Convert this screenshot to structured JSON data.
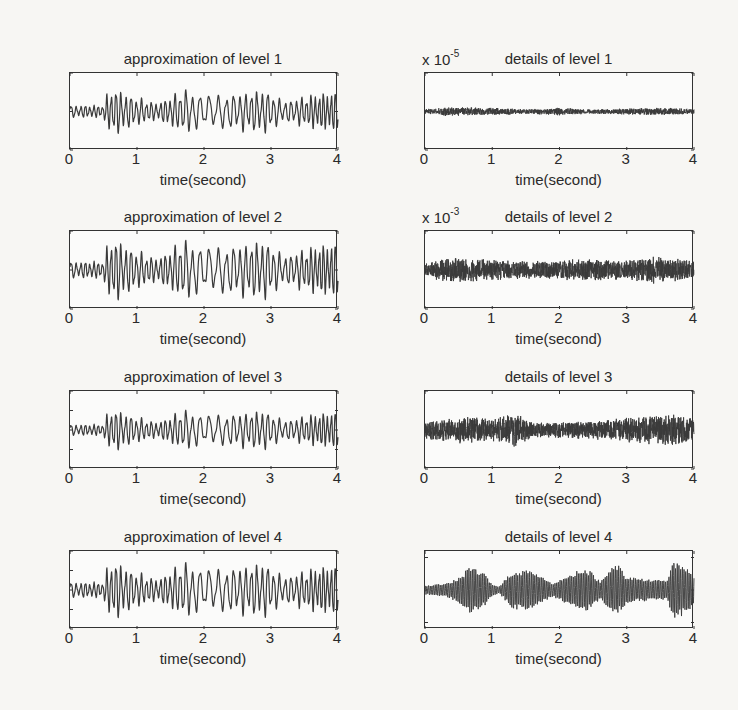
{
  "chart_data": [
    {
      "type": "line",
      "id": "a1",
      "title": "approximation of level 1",
      "xlabel": "time(second)",
      "ylabel": "",
      "xlim": [
        0,
        4
      ],
      "ylim": [
        -20,
        20
      ],
      "xticks": [
        "0",
        "1",
        "2",
        "3",
        "4"
      ],
      "yticks": [
        "20",
        "0",
        "-20"
      ],
      "multiplier": "",
      "grid": false,
      "signal": {
        "kind": "approx",
        "amp": 1.0,
        "freq": 12,
        "envelope": [
          [
            0,
            3
          ],
          [
            0.5,
            3
          ],
          [
            0.55,
            8
          ],
          [
            0.65,
            12
          ],
          [
            0.9,
            8
          ],
          [
            1.3,
            4
          ],
          [
            1.7,
            11
          ],
          [
            2.0,
            8
          ],
          [
            2.5,
            9
          ],
          [
            2.9,
            11
          ],
          [
            3.2,
            5
          ],
          [
            3.7,
            9
          ],
          [
            4.0,
            10
          ]
        ]
      }
    },
    {
      "type": "line",
      "id": "d1",
      "title": "details of level 1",
      "xlabel": "time(second)",
      "ylabel": "",
      "xlim": [
        0,
        4
      ],
      "ylim": [
        -5,
        5
      ],
      "xticks": [
        "0",
        "1",
        "2",
        "3",
        "4"
      ],
      "yticks": [
        "5",
        "0",
        "-5"
      ],
      "multiplier": "x 10",
      "multiplier_exp": "-5",
      "grid": false,
      "signal": {
        "kind": "noise",
        "freq": 90,
        "envelope": [
          [
            0,
            0.3
          ],
          [
            0.3,
            0.6
          ],
          [
            1.0,
            0.5
          ],
          [
            1.5,
            0.3
          ],
          [
            2.0,
            0.5
          ],
          [
            2.5,
            0.3
          ],
          [
            3.5,
            0.5
          ],
          [
            4.0,
            0.4
          ]
        ]
      }
    },
    {
      "type": "line",
      "id": "a2",
      "title": "approximation of level 2",
      "xlabel": "time(second)",
      "ylabel": "",
      "xlim": [
        0,
        4
      ],
      "ylim": [
        -20,
        20
      ],
      "xticks": [
        "0",
        "1",
        "2",
        "3",
        "4"
      ],
      "yticks": [
        "20",
        "0",
        "-20"
      ],
      "multiplier": "",
      "grid": false,
      "signal": {
        "kind": "approx",
        "amp": 1.35,
        "freq": 12,
        "envelope": [
          [
            0,
            3
          ],
          [
            0.5,
            3
          ],
          [
            0.55,
            8
          ],
          [
            0.65,
            12
          ],
          [
            0.9,
            8
          ],
          [
            1.3,
            4
          ],
          [
            1.7,
            11
          ],
          [
            2.0,
            8
          ],
          [
            2.5,
            9
          ],
          [
            2.9,
            11
          ],
          [
            3.2,
            5
          ],
          [
            3.7,
            9
          ],
          [
            4.0,
            10
          ]
        ]
      }
    },
    {
      "type": "line",
      "id": "d2",
      "title": "details of level 2",
      "xlabel": "time(second)",
      "ylabel": "",
      "xlim": [
        0,
        4
      ],
      "ylim": [
        -5,
        5
      ],
      "xticks": [
        "0",
        "1",
        "2",
        "3",
        "4"
      ],
      "yticks": [
        "5",
        "0",
        "-5"
      ],
      "multiplier": "x 10",
      "multiplier_exp": "-3",
      "grid": false,
      "signal": {
        "kind": "noise",
        "freq": 90,
        "envelope": [
          [
            0,
            0.8
          ],
          [
            0.3,
            1.6
          ],
          [
            0.6,
            1.6
          ],
          [
            1.0,
            1.4
          ],
          [
            1.5,
            1.2
          ],
          [
            2.0,
            1.2
          ],
          [
            2.3,
            1.6
          ],
          [
            3.0,
            1.2
          ],
          [
            3.4,
            1.8
          ],
          [
            4.0,
            1.2
          ]
        ]
      }
    },
    {
      "type": "line",
      "id": "a3",
      "title": "approximation of level 3",
      "xlabel": "time(second)",
      "ylabel": "",
      "xlim": [
        0,
        4
      ],
      "ylim": [
        -40,
        40
      ],
      "xticks": [
        "0",
        "1",
        "2",
        "3",
        "4"
      ],
      "yticks": [
        "40",
        "20",
        "0",
        "-20",
        "-40"
      ],
      "multiplier": "",
      "grid": false,
      "signal": {
        "kind": "approx",
        "amp": 1.8,
        "freq": 12,
        "envelope": [
          [
            0,
            3
          ],
          [
            0.5,
            3
          ],
          [
            0.55,
            8
          ],
          [
            0.65,
            12
          ],
          [
            0.9,
            8
          ],
          [
            1.3,
            4
          ],
          [
            1.7,
            11
          ],
          [
            2.0,
            8
          ],
          [
            2.5,
            9
          ],
          [
            2.9,
            11
          ],
          [
            3.2,
            5
          ],
          [
            3.7,
            9
          ],
          [
            4.0,
            10
          ]
        ]
      }
    },
    {
      "type": "line",
      "id": "d3",
      "title": "details of level 3",
      "xlabel": "time(second)",
      "ylabel": "",
      "xlim": [
        0,
        4
      ],
      "ylim": [
        -0.5,
        0.5
      ],
      "xticks": [
        "0",
        "1",
        "2",
        "3",
        "4"
      ],
      "yticks": [
        "0.5",
        "0",
        "-0.5"
      ],
      "multiplier": "",
      "grid": false,
      "signal": {
        "kind": "noise",
        "freq": 60,
        "envelope": [
          [
            0,
            0.12
          ],
          [
            0.6,
            0.18
          ],
          [
            1.0,
            0.14
          ],
          [
            1.35,
            0.22
          ],
          [
            1.6,
            0.1
          ],
          [
            2.5,
            0.12
          ],
          [
            3.2,
            0.18
          ],
          [
            3.7,
            0.2
          ],
          [
            4.0,
            0.16
          ]
        ]
      }
    },
    {
      "type": "line",
      "id": "a4",
      "title": "approximation of level 4",
      "xlabel": "time(second)",
      "ylabel": "",
      "xlim": [
        0,
        4
      ],
      "ylim": [
        -40,
        40
      ],
      "xticks": [
        "0",
        "1",
        "2",
        "3",
        "4"
      ],
      "yticks": [
        "40",
        "20",
        "0",
        "-20",
        "-40"
      ],
      "multiplier": "",
      "grid": false,
      "signal": {
        "kind": "approx",
        "amp": 2.5,
        "freq": 12,
        "envelope": [
          [
            0,
            3
          ],
          [
            0.5,
            3
          ],
          [
            0.55,
            8
          ],
          [
            0.65,
            12
          ],
          [
            0.9,
            8
          ],
          [
            1.3,
            4
          ],
          [
            1.7,
            11
          ],
          [
            2.0,
            8
          ],
          [
            2.5,
            9
          ],
          [
            2.9,
            11
          ],
          [
            3.2,
            5
          ],
          [
            3.7,
            9
          ],
          [
            4.0,
            10
          ]
        ]
      }
    },
    {
      "type": "line",
      "id": "d4",
      "title": "details of level 4",
      "xlabel": "time(second)",
      "ylabel": "",
      "xlim": [
        0,
        4
      ],
      "ylim": [
        -12,
        12
      ],
      "xticks": [
        "0",
        "1",
        "2",
        "3",
        "4"
      ],
      "yticks": [
        "10",
        "0",
        "-10"
      ],
      "multiplier": "",
      "grid": false,
      "signal": {
        "kind": "bursts",
        "freq": 40,
        "envelope": [
          [
            0,
            1.5
          ],
          [
            0.3,
            2
          ],
          [
            0.5,
            4
          ],
          [
            0.68,
            7.5
          ],
          [
            0.9,
            5
          ],
          [
            1.0,
            2
          ],
          [
            1.1,
            1
          ],
          [
            1.3,
            6
          ],
          [
            1.5,
            6.5
          ],
          [
            1.75,
            4
          ],
          [
            1.9,
            2
          ],
          [
            2.15,
            5
          ],
          [
            2.4,
            7
          ],
          [
            2.45,
            6
          ],
          [
            2.6,
            3
          ],
          [
            2.85,
            8.5
          ],
          [
            3.0,
            4
          ],
          [
            3.3,
            3.5
          ],
          [
            3.6,
            3
          ],
          [
            3.7,
            9
          ],
          [
            3.85,
            8
          ],
          [
            4.0,
            5
          ]
        ]
      }
    }
  ],
  "layout": {
    "columns": [
      {
        "axes_left": 69,
        "axes_width": 268
      },
      {
        "axes_left": 424,
        "axes_width": 269
      }
    ],
    "rows": [
      {
        "axes_top": 72,
        "axes_height": 77
      },
      {
        "axes_top": 230,
        "axes_height": 78
      },
      {
        "axes_top": 390,
        "axes_height": 78
      },
      {
        "axes_top": 550,
        "axes_height": 78
      }
    ],
    "line_color": "#3a3a3a",
    "axes_color": "#333333",
    "background": "#f7f6f3"
  }
}
